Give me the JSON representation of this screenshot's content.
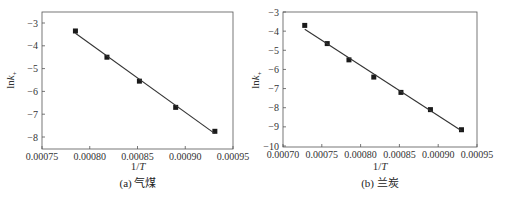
{
  "chart_data": [
    {
      "type": "scatter",
      "panel": "a",
      "caption": "(a) 气煤",
      "title": "",
      "xlabel": "1/T",
      "ylabel": "lnk+",
      "xlim": [
        0.00075,
        0.00095
      ],
      "ylim": [
        -8.5,
        -2.5
      ],
      "xticks": [
        "0.00075",
        "0.00080",
        "0.00085",
        "0.00090",
        "0.00095"
      ],
      "yticks": [
        "-3",
        "-4",
        "-5",
        "-6",
        "-7",
        "-8"
      ],
      "grid": false,
      "series": [
        {
          "name": "data",
          "marker": "square",
          "x": [
            0.000785,
            0.000818,
            0.000852,
            0.00089,
            0.000931
          ],
          "y": [
            -3.35,
            -4.5,
            -5.55,
            -6.7,
            -7.75
          ]
        },
        {
          "name": "linear fit",
          "style": "line",
          "x": [
            0.000785,
            0.000931
          ],
          "y": [
            -3.45,
            -7.85
          ]
        }
      ]
    },
    {
      "type": "scatter",
      "panel": "b",
      "caption": "(b) 兰炭",
      "title": "",
      "xlabel": "1/T",
      "ylabel": "lnk+",
      "xlim": [
        0.0007,
        0.00095
      ],
      "ylim": [
        -10,
        -3
      ],
      "xticks": [
        "0.00070",
        "0.00075",
        "0.00080",
        "0.00085",
        "0.00090",
        "0.00095"
      ],
      "yticks": [
        "-3",
        "-4",
        "-5",
        "-6",
        "-7",
        "-8",
        "-9",
        "-10"
      ],
      "grid": false,
      "series": [
        {
          "name": "data",
          "marker": "square",
          "x": [
            0.000728,
            0.000757,
            0.000785,
            0.000817,
            0.000852,
            0.00089,
            0.00093
          ],
          "y": [
            -3.7,
            -4.65,
            -5.5,
            -6.4,
            -7.2,
            -8.1,
            -9.15
          ]
        },
        {
          "name": "linear fit",
          "style": "line",
          "x": [
            0.000728,
            0.00093
          ],
          "y": [
            -3.9,
            -9.2
          ]
        }
      ]
    }
  ],
  "panels": {
    "a": {
      "caption": "(a) 气煤",
      "xlabel": "1/T",
      "ylabel_main": "lnk",
      "ylabel_sub": "+"
    },
    "b": {
      "caption": "(b) 兰炭",
      "xlabel": "1/T",
      "ylabel_main": "lnk",
      "ylabel_sub": "+"
    }
  }
}
